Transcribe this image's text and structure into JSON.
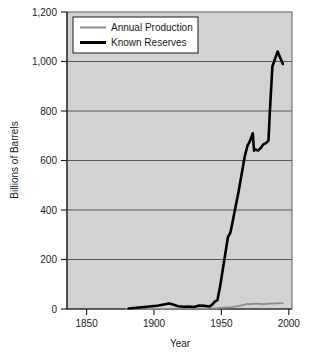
{
  "chart_data": {
    "type": "line",
    "title": "",
    "xlabel": "Year",
    "ylabel": "Billions of Barrels",
    "xlim": [
      1835,
      2007
    ],
    "ylim": [
      0,
      1200
    ],
    "xticks": [
      "1850",
      "1900",
      "1950",
      "2000"
    ],
    "xtick_values": [
      1850,
      1900,
      1950,
      2000
    ],
    "yticks": [
      "0",
      "200",
      "400",
      "600",
      "800",
      "1,000",
      "1,200"
    ],
    "ytick_values": [
      0,
      200,
      400,
      600,
      800,
      1000,
      1200
    ],
    "grid": true,
    "grid_axis": "y",
    "legend_position": "top-left",
    "plot_background": "#d2d2d2",
    "series": [
      {
        "name": "Annual Production",
        "color": "#8c8c8c",
        "x": [
          1880,
          1900,
          1920,
          1930,
          1940,
          1945,
          1950,
          1955,
          1960,
          1965,
          1970,
          1973,
          1975,
          1980,
          1985,
          1990,
          1995,
          2000
        ],
        "values": [
          0,
          0.2,
          0.7,
          1.4,
          2.1,
          2.6,
          3.8,
          5.6,
          7.7,
          11.0,
          16.7,
          20.4,
          19.5,
          21.7,
          19.8,
          22.1,
          22.8,
          23.4
        ]
      },
      {
        "name": "Known Reserves",
        "color": "#000000",
        "x": [
          1882,
          1890,
          1896,
          1900,
          1905,
          1910,
          1913,
          1916,
          1920,
          1924,
          1928,
          1932,
          1936,
          1940,
          1944,
          1946,
          1948,
          1950,
          1952,
          1955,
          1958,
          1960,
          1963,
          1966,
          1969,
          1971,
          1973,
          1975,
          1977,
          1978,
          1979,
          1981,
          1983,
          1985,
          1987,
          1989,
          1990,
          1992,
          1994,
          1996,
          1998,
          2000
        ],
        "values": [
          2,
          6,
          9,
          11,
          14,
          19,
          22,
          18,
          11,
          9,
          10,
          8,
          14,
          13,
          10,
          18,
          30,
          36,
          90,
          190,
          290,
          310,
          390,
          470,
          560,
          620,
          660,
          680,
          710,
          640,
          645,
          640,
          650,
          665,
          670,
          680,
          790,
          980,
          1010,
          1040,
          1015,
          990
        ]
      }
    ]
  },
  "legend": {
    "items": [
      {
        "label": "Annual Production",
        "color": "#8c8c8c",
        "thickness": 2
      },
      {
        "label": "Known Reserves",
        "color": "#000000",
        "thickness": 3
      }
    ]
  },
  "axes": {
    "y_title": "Billions of Barrels",
    "x_title": "Year",
    "y_labels": [
      "1,200",
      "1,000",
      "800",
      "600",
      "400",
      "200",
      "0"
    ],
    "x_labels": [
      "1850",
      "1900",
      "1950",
      "2000"
    ]
  }
}
